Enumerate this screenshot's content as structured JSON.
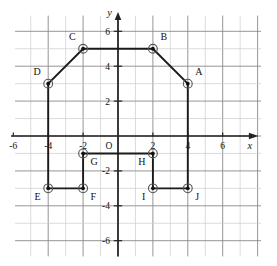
{
  "figure": {
    "type": "coordinate-plane",
    "title": "",
    "origin_label": "O",
    "axes": {
      "x_name": "x",
      "y_name": "y",
      "x_ticks": [
        "-6",
        "-4",
        "-2",
        "2",
        "4",
        "6"
      ],
      "y_ticks": [
        "6",
        "4",
        "2",
        "-2",
        "-4",
        "-6"
      ],
      "x_range": [
        -7,
        7
      ],
      "y_range": [
        -7,
        7
      ],
      "x_tick_values": [
        -6,
        -4,
        -2,
        2,
        4,
        6
      ],
      "y_tick_values": [
        6,
        4,
        2,
        -2,
        -4,
        -6
      ],
      "grid": true,
      "grid_step": 1
    },
    "colors": {
      "axis": "#222222",
      "grid_major": "#8a8a8a",
      "grid_minor": "#cccccc",
      "polygon_stroke": "#1a1a1a",
      "point_fill": "#111111",
      "point_ring": "#555555",
      "background": "#ffffff",
      "label_text": "#111111"
    }
  },
  "chart_data": {
    "type": "scatter",
    "title": "",
    "xlabel": "x",
    "ylabel": "y",
    "xlim": [
      -7,
      7
    ],
    "ylim": [
      -7,
      7
    ],
    "grid": true,
    "legend": "none",
    "points": [
      {
        "label": "A",
        "x": 4,
        "y": 3,
        "label_pos": "above-right"
      },
      {
        "label": "B",
        "x": 2,
        "y": 5,
        "label_pos": "above-right"
      },
      {
        "label": "C",
        "x": -2,
        "y": 5,
        "label_pos": "above-left"
      },
      {
        "label": "D",
        "x": -4,
        "y": 3,
        "label_pos": "above-left"
      },
      {
        "label": "E",
        "x": -4,
        "y": -3,
        "label_pos": "below-left"
      },
      {
        "label": "F",
        "x": -2,
        "y": -3,
        "label_pos": "below-right"
      },
      {
        "label": "G",
        "x": -2,
        "y": -1,
        "label_pos": "below-right"
      },
      {
        "label": "H",
        "x": 2,
        "y": -1,
        "label_pos": "below-left"
      },
      {
        "label": "I",
        "x": 2,
        "y": -3,
        "label_pos": "below-left"
      },
      {
        "label": "J",
        "x": 4,
        "y": -3,
        "label_pos": "below-right"
      }
    ],
    "polygon_order": [
      "D",
      "C",
      "B",
      "A",
      "J",
      "I",
      "H",
      "G",
      "F",
      "E"
    ],
    "closed": true
  }
}
